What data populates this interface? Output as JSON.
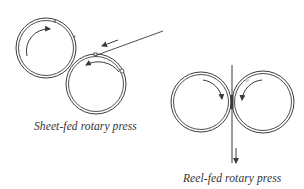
{
  "figure": {
    "background": "#ffffff",
    "stroke_color": "#3a3a3a",
    "panels": [
      {
        "id": "sheet-fed",
        "caption": "Sheet-fed rotary press",
        "cylinders": [
          {
            "name": "upper-cylinder",
            "cx": 46,
            "cy": 48,
            "r": 30,
            "rotation": "clockwise"
          },
          {
            "name": "lower-cylinder",
            "cx": 96,
            "cy": 84,
            "r": 30,
            "rotation": "counter-clockwise"
          }
        ],
        "feed": {
          "type": "sheet",
          "direction": "into nip from upper right"
        }
      },
      {
        "id": "reel-fed",
        "caption": "Reel-fed rotary press",
        "cylinders": [
          {
            "name": "left-cylinder",
            "cx": 201,
            "cy": 102,
            "r": 30,
            "rotation": "clockwise"
          },
          {
            "name": "right-cylinder",
            "cx": 263,
            "cy": 102,
            "r": 31,
            "rotation": "counter-clockwise"
          }
        ],
        "feed": {
          "type": "web",
          "direction": "downward through nip"
        }
      }
    ]
  }
}
